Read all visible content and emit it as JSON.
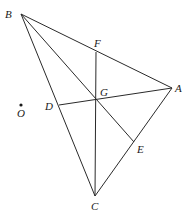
{
  "diagram": {
    "type": "geometry",
    "points": {
      "A": {
        "x": 172,
        "y": 88,
        "label": "A"
      },
      "B": {
        "x": 21,
        "y": 14,
        "label": "B"
      },
      "C": {
        "x": 95,
        "y": 196,
        "label": "C"
      },
      "D": {
        "x": 59,
        "y": 105,
        "label": "D"
      },
      "E": {
        "x": 134,
        "y": 142,
        "label": "E"
      },
      "F": {
        "x": 96,
        "y": 52,
        "label": "F"
      },
      "G": {
        "x": 96,
        "y": 100,
        "label": "G"
      },
      "O": {
        "x": 21,
        "y": 105,
        "label": "O"
      }
    },
    "segments": [
      [
        "B",
        "A"
      ],
      [
        "B",
        "C"
      ],
      [
        "C",
        "A"
      ],
      [
        "B",
        "E"
      ],
      [
        "F",
        "C"
      ],
      [
        "D",
        "A"
      ]
    ],
    "labels": {
      "A": "A",
      "B": "B",
      "C": "C",
      "D": "D",
      "E": "E",
      "F": "F",
      "G": "G",
      "O": "O"
    },
    "stroke_color": "#2a2a2a",
    "background": "#ffffff"
  }
}
